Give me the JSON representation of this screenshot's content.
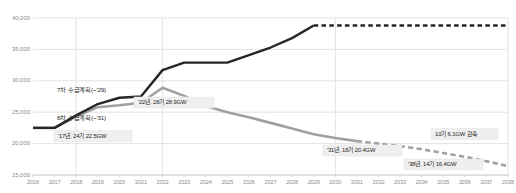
{
  "chart_data": {
    "type": "line",
    "title": "",
    "xlabel": "",
    "ylabel": "",
    "grid": true,
    "legend": "annotations-inline",
    "x": [
      2016,
      2017,
      2018,
      2019,
      2020,
      2021,
      2022,
      2023,
      2024,
      2025,
      2026,
      2027,
      2028,
      2029,
      2030,
      2031,
      2032,
      2033,
      2034,
      2035,
      2036,
      2037,
      2038
    ],
    "xlim": [
      2016,
      2038
    ],
    "ylim": [
      15000,
      40000
    ],
    "yticks": [
      15000,
      20000,
      25000,
      30000,
      35000,
      40000
    ],
    "ytick_labels": [
      "15,000",
      "20,000",
      "25,000",
      "30,000",
      "35,000",
      "40,000"
    ],
    "xtick_labels": [
      "2016",
      "2017",
      "2018",
      "2019",
      "2020",
      "2021",
      "2022",
      "2023",
      "2024",
      "2025",
      "2026",
      "2027",
      "2028",
      "2029",
      "2030",
      "2031",
      "2032",
      "2033",
      "2034",
      "2035",
      "2036",
      "2037",
      "2038"
    ],
    "series": [
      {
        "name": "7차 수급계획(~'29)",
        "color": "#262626",
        "solid_until": 2029,
        "values": [
          22500,
          22500,
          24500,
          26300,
          27300,
          27500,
          31700,
          32900,
          32900,
          32900,
          34100,
          35300,
          36800,
          38800,
          38800,
          38800,
          38800,
          38800,
          38800,
          38800,
          38800,
          38800,
          38800
        ]
      },
      {
        "name": "8차 수급계획(~'31)",
        "color": "#a0a0a0",
        "solid_until": 2031,
        "values": [
          22500,
          22500,
          24300,
          25800,
          26100,
          26500,
          28900,
          27600,
          26000,
          25000,
          24200,
          23300,
          22400,
          21500,
          20900,
          20400,
          20000,
          19600,
          19100,
          18500,
          17900,
          17200,
          16400
        ]
      }
    ],
    "annotations": [
      {
        "id": "plan7-label",
        "text": "7차 수급계획(~'29)",
        "style": "plain"
      },
      {
        "id": "plan8-label",
        "text": "8차 수급계획(~'31)",
        "style": "plain"
      },
      {
        "id": "y2017-label",
        "text": "'17년, 24기 22.5GW",
        "style": "box"
      },
      {
        "id": "y2022-label",
        "text": "'22년, 28기 28.9GW",
        "style": "box"
      },
      {
        "id": "y2031-label",
        "text": "'31년, 18기 20.4GW",
        "style": "box"
      },
      {
        "id": "y2038-label",
        "text": "'38년, 14기 16.4GW",
        "style": "box"
      },
      {
        "id": "reduction-label",
        "text": "10기 6.1GW 감축",
        "style": "box"
      }
    ]
  },
  "colors": {
    "series_dark": "#262626",
    "series_gray": "#a0a0a0",
    "gridline": "#d7d7d7",
    "tick_text": "#8d8d8d",
    "callout_bg": "#efefef"
  }
}
